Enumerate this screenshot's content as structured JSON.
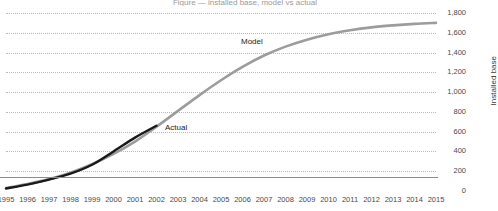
{
  "title_sliver": "Figure — installed base, model vs actual",
  "axes": {
    "y_title": "Installed base",
    "y_ticks": [
      "1,800",
      "1,600",
      "1,400",
      "1,200",
      "1,000",
      "800",
      "600",
      "400",
      "200",
      "0"
    ],
    "x_ticks": [
      "1995",
      "1996",
      "1997",
      "1998",
      "1999",
      "2000",
      "2001",
      "2002",
      "2003",
      "2004",
      "2005",
      "2006",
      "2007",
      "2008",
      "2009",
      "2010",
      "2011",
      "2012",
      "2013",
      "2014",
      "2015"
    ]
  },
  "annotations": {
    "model": "Model",
    "actual": "Actual"
  },
  "colors": {
    "model_line": "#9c9c9c",
    "actual_line": "#1a1a1a",
    "gridline": "#b9b9b9",
    "baseline": "#8c8c8c",
    "text": "#3b3b3b"
  },
  "chart_data": {
    "type": "line",
    "title": "",
    "xlabel": "",
    "ylabel": "Installed base",
    "x": [
      1995,
      1996,
      1997,
      1998,
      1999,
      2000,
      2001,
      2002,
      2003,
      2004,
      2005,
      2006,
      2007,
      2008,
      2009,
      2010,
      2011,
      2012,
      2013,
      2014,
      2015
    ],
    "xlim": [
      1995,
      2015
    ],
    "ylim": [
      0,
      1800
    ],
    "y_tick_step": 200,
    "grid": true,
    "legend": "annotations-inline",
    "series": [
      {
        "name": "Model",
        "color": "#9c9c9c",
        "values": [
          30,
          70,
          120,
          185,
          270,
          375,
          500,
          650,
          810,
          970,
          1120,
          1255,
          1370,
          1460,
          1530,
          1585,
          1625,
          1655,
          1675,
          1690,
          1700
        ]
      },
      {
        "name": "Actual",
        "color": "#1a1a1a",
        "values": [
          25,
          65,
          115,
          175,
          265,
          400,
          540,
          660,
          null,
          null,
          null,
          null,
          null,
          null,
          null,
          null,
          null,
          null,
          null,
          null,
          null
        ]
      }
    ]
  }
}
